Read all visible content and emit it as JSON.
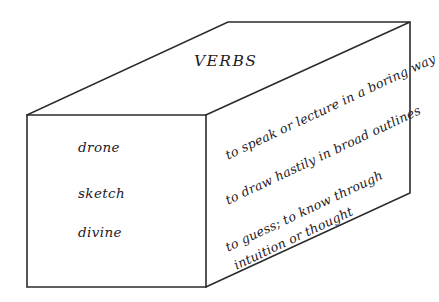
{
  "diagram": {
    "type": "3d-box-vocabulary-card",
    "title": "VERBS",
    "background_color": "#ffffff",
    "line_color": "#2b2b2b",
    "text_color": "#23201f",
    "entries": [
      {
        "word": "drone",
        "definition": "to speak or lecture in a boring way"
      },
      {
        "word": "sketch",
        "definition": "to draw hastily in broad outlines"
      },
      {
        "word": "divine",
        "definition": "to guess; to know through intuition or thought"
      }
    ]
  }
}
